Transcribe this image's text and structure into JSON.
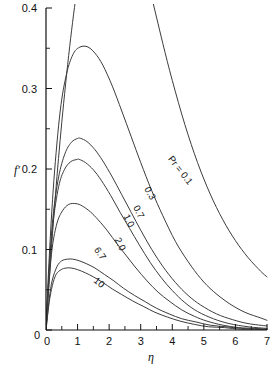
{
  "chart_data": {
    "type": "line",
    "title": "",
    "subtitle": "",
    "xlabel": "η",
    "ylabel": "f′",
    "xlim": [
      0,
      7
    ],
    "ylim": [
      0,
      0.4
    ],
    "grid": false,
    "legend_position": "inline-curve-labels",
    "x_ticks": [
      0,
      1,
      2,
      3,
      4,
      5,
      6,
      7
    ],
    "x_tick_labels": [
      "0",
      "1",
      "2",
      "3",
      "4",
      "5",
      "6",
      "7"
    ],
    "x_minor_ticks": [
      0.5,
      1.5,
      2.5,
      3.5,
      4.5,
      5.5,
      6.5
    ],
    "y_ticks": [
      0,
      0.1,
      0.2,
      0.3,
      0.4
    ],
    "y_tick_labels": [
      "0",
      "0.1",
      "0.2",
      "0.3",
      "0.4"
    ],
    "y_minor_ticks": [
      0.05,
      0.15,
      0.25,
      0.35
    ],
    "series_parameter_name": "Pr",
    "first_series_label": "Pr = 0.1",
    "series": [
      {
        "name": "0.1",
        "label": "Pr = 0.1",
        "label_x": 4.18,
        "label_y": 0.196,
        "label_rotation": 52,
        "peak": {
          "x": 1.9,
          "y": 0.58
        },
        "clipped_at_top": true,
        "x": [
          0,
          0.12,
          0.3,
          0.5,
          0.75,
          1.0,
          1.3,
          1.6,
          1.9,
          2.2,
          2.5,
          2.8,
          3.1,
          3.4,
          3.7,
          4.0,
          4.4,
          4.8,
          5.2,
          5.6,
          6.0,
          6.4,
          6.8,
          7.0
        ],
        "y": [
          0,
          0.073,
          0.168,
          0.258,
          0.352,
          0.428,
          0.498,
          0.545,
          0.566,
          0.562,
          0.538,
          0.5,
          0.454,
          0.405,
          0.356,
          0.31,
          0.255,
          0.208,
          0.169,
          0.137,
          0.111,
          0.09,
          0.073,
          0.066
        ]
      },
      {
        "name": "0.3",
        "label": "0.3",
        "label_x": 3.21,
        "label_y": 0.168,
        "label_rotation": 60,
        "peak": {
          "x": 1.3,
          "y": 0.352
        },
        "clipped_at_top": false,
        "x": [
          0,
          0.1,
          0.25,
          0.45,
          0.65,
          0.85,
          1.05,
          1.3,
          1.55,
          1.8,
          2.1,
          2.4,
          2.7,
          3.0,
          3.35,
          3.7,
          4.1,
          4.5,
          4.9,
          5.3,
          5.8,
          6.3,
          6.8,
          7.0
        ],
        "y": [
          0,
          0.089,
          0.186,
          0.272,
          0.318,
          0.342,
          0.351,
          0.352,
          0.344,
          0.329,
          0.303,
          0.272,
          0.24,
          0.208,
          0.173,
          0.142,
          0.11,
          0.085,
          0.064,
          0.048,
          0.033,
          0.022,
          0.015,
          0.012
        ]
      },
      {
        "name": "0.7",
        "label": "0.7",
        "label_x": 2.85,
        "label_y": 0.145,
        "label_rotation": 62,
        "peak": {
          "x": 1.1,
          "y": 0.238
        },
        "clipped_at_top": false,
        "x": [
          0,
          0.1,
          0.22,
          0.4,
          0.6,
          0.8,
          1.0,
          1.1,
          1.3,
          1.55,
          1.8,
          2.1,
          2.4,
          2.7,
          3.0,
          3.35,
          3.7,
          4.1,
          4.5,
          4.9,
          5.4,
          5.9,
          6.4,
          7.0
        ],
        "y": [
          0,
          0.075,
          0.14,
          0.19,
          0.219,
          0.233,
          0.238,
          0.238,
          0.234,
          0.224,
          0.21,
          0.19,
          0.168,
          0.146,
          0.124,
          0.1,
          0.079,
          0.059,
          0.043,
          0.031,
          0.02,
          0.013,
          0.008,
          0.005
        ]
      },
      {
        "name": "1.0",
        "label": "1.0",
        "label_x": 2.54,
        "label_y": 0.134,
        "label_rotation": 63,
        "peak": {
          "x": 1.05,
          "y": 0.212
        },
        "clipped_at_top": false,
        "x": [
          0,
          0.1,
          0.22,
          0.4,
          0.58,
          0.78,
          1.0,
          1.05,
          1.25,
          1.5,
          1.75,
          2.05,
          2.35,
          2.65,
          2.95,
          3.3,
          3.65,
          4.0,
          4.4,
          4.8,
          5.3,
          5.8,
          6.4,
          7.0
        ],
        "y": [
          0,
          0.072,
          0.132,
          0.178,
          0.199,
          0.209,
          0.212,
          0.212,
          0.208,
          0.199,
          0.186,
          0.167,
          0.146,
          0.126,
          0.106,
          0.084,
          0.065,
          0.049,
          0.034,
          0.023,
          0.014,
          0.008,
          0.004,
          0.002
        ]
      },
      {
        "name": "2.0",
        "label": "2.0",
        "label_x": 2.26,
        "label_y": 0.105,
        "label_rotation": 64,
        "peak": {
          "x": 0.95,
          "y": 0.157
        },
        "clipped_at_top": false,
        "x": [
          0,
          0.1,
          0.2,
          0.35,
          0.52,
          0.72,
          0.95,
          1.15,
          1.4,
          1.65,
          1.95,
          2.25,
          2.55,
          2.85,
          3.2,
          3.55,
          3.9,
          4.3,
          4.7,
          5.1,
          5.6,
          6.1,
          6.6,
          7.0
        ],
        "y": [
          0,
          0.06,
          0.103,
          0.133,
          0.148,
          0.156,
          0.157,
          0.154,
          0.147,
          0.137,
          0.123,
          0.107,
          0.092,
          0.077,
          0.061,
          0.047,
          0.036,
          0.025,
          0.017,
          0.011,
          0.006,
          0.003,
          0.002,
          0.001
        ]
      },
      {
        "name": "6.7",
        "label": "6.7",
        "label_x": 1.63,
        "label_y": 0.093,
        "label_rotation": 56,
        "peak": {
          "x": 0.85,
          "y": 0.088
        },
        "clipped_at_top": false,
        "x": [
          0,
          0.1,
          0.2,
          0.35,
          0.5,
          0.68,
          0.85,
          1.05,
          1.3,
          1.55,
          1.85,
          2.15,
          2.45,
          2.8,
          3.15,
          3.5,
          3.9,
          4.3,
          4.75,
          5.2,
          5.7,
          6.2,
          6.7,
          7.0
        ],
        "y": [
          0,
          0.038,
          0.062,
          0.079,
          0.086,
          0.088,
          0.088,
          0.086,
          0.082,
          0.077,
          0.069,
          0.061,
          0.052,
          0.043,
          0.035,
          0.027,
          0.02,
          0.014,
          0.01,
          0.006,
          0.004,
          0.002,
          0.001,
          0.001
        ]
      },
      {
        "name": "10",
        "label": "10",
        "label_x": 1.62,
        "label_y": 0.056,
        "label_rotation": 40,
        "peak": {
          "x": 0.8,
          "y": 0.077
        },
        "clipped_at_top": false,
        "x": [
          0,
          0.1,
          0.2,
          0.32,
          0.48,
          0.64,
          0.8,
          1.0,
          1.25,
          1.5,
          1.8,
          2.1,
          2.4,
          2.75,
          3.1,
          3.45,
          3.85,
          4.25,
          4.7,
          5.15,
          5.65,
          6.15,
          6.65,
          7.0
        ],
        "y": [
          0,
          0.034,
          0.055,
          0.069,
          0.075,
          0.077,
          0.077,
          0.075,
          0.071,
          0.066,
          0.059,
          0.051,
          0.044,
          0.036,
          0.029,
          0.022,
          0.016,
          0.011,
          0.007,
          0.004,
          0.003,
          0.001,
          0.001,
          0.0
        ]
      }
    ]
  },
  "colors": {
    "curve": "#3c3c3c",
    "axis": "#111111",
    "background": "#ffffff",
    "text": "#111111"
  }
}
